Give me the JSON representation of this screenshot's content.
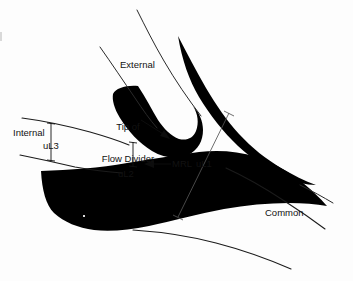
{
  "figure": {
    "background_color": "#fdfdfd",
    "ink_color": "#000000"
  },
  "labels": {
    "external": "External",
    "internal": "Internal",
    "common": "Common",
    "tip_of_flow_divider_line1": "Tip of",
    "tip_of_flow_divider_line2": "Flow Divider",
    "mrl": "MRL",
    "ul1": "uL1",
    "ul2": "uL2",
    "ul3": "uL3"
  },
  "annotations": [
    {
      "name": "external-branch-label",
      "text": "External"
    },
    {
      "name": "internal-branch-label",
      "text": "Internal"
    },
    {
      "name": "common-branch-label",
      "text": "Common"
    },
    {
      "name": "flow-divider-callout",
      "text": "Tip of Flow Divider"
    },
    {
      "name": "mrl-callout",
      "text": "MRL"
    },
    {
      "name": "ul1-measure-label",
      "text": "uL1"
    },
    {
      "name": "ul2-measure-label",
      "text": "uL2"
    },
    {
      "name": "ul3-measure-label",
      "text": "uL3"
    }
  ]
}
